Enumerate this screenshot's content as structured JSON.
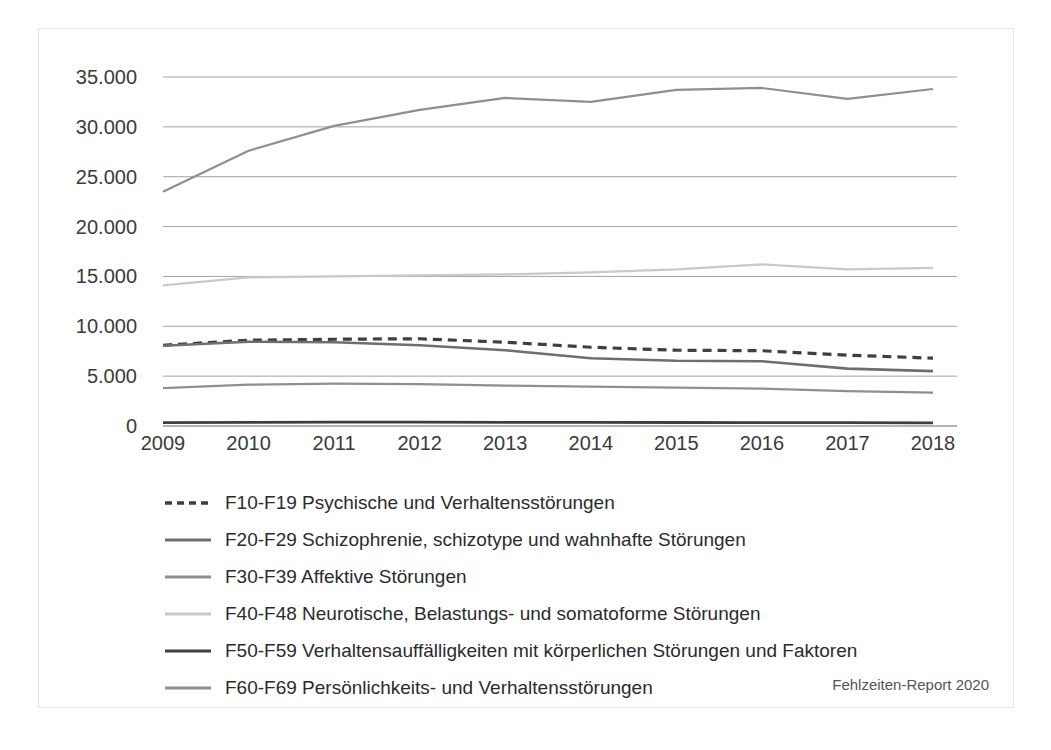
{
  "chart_data": {
    "type": "line",
    "title": "",
    "subtitle": "",
    "xlabel": "",
    "ylabel": "",
    "x": [
      2009,
      2010,
      2011,
      2012,
      2013,
      2014,
      2015,
      2016,
      2017,
      2018
    ],
    "categories": [
      "2009",
      "2010",
      "2011",
      "2012",
      "2013",
      "2014",
      "2015",
      "2016",
      "2017",
      "2018"
    ],
    "ylim": [
      0,
      35000
    ],
    "yticks": [
      0,
      5000,
      10000,
      15000,
      20000,
      25000,
      30000,
      35000
    ],
    "ytick_labels": [
      "0",
      "5.000",
      "10.000",
      "15.000",
      "20.000",
      "25.000",
      "30.000",
      "35.000"
    ],
    "grid": true,
    "legend_position": "below",
    "series": [
      {
        "name": "F10-F19 Psychische und Verhaltensstörungen",
        "color": "#3f3f3f",
        "style": "dashed",
        "width": 3.2,
        "values": [
          8100,
          8600,
          8700,
          8750,
          8400,
          7900,
          7600,
          7550,
          7100,
          6800
        ]
      },
      {
        "name": "F20-F29 Schizophrenie, schizotype und wahnhafte Störungen",
        "color": "#6e6e6e",
        "style": "solid",
        "width": 2.6,
        "values": [
          8050,
          8450,
          8400,
          8100,
          7600,
          6800,
          6550,
          6500,
          5750,
          5500
        ]
      },
      {
        "name": "F30-F39 Affektive Störungen",
        "color": "#8f8f8f",
        "style": "solid",
        "width": 2.2,
        "values": [
          23500,
          27600,
          30100,
          31700,
          32900,
          32500,
          33700,
          33900,
          32800,
          33800
        ]
      },
      {
        "name": "F40-F48 Neurotische, Belastungs- und somatoforme Störungen",
        "color": "#c9c9c9",
        "style": "solid",
        "width": 2.2,
        "values": [
          14100,
          14900,
          15000,
          15100,
          15200,
          15400,
          15700,
          16200,
          15700,
          15850
        ]
      },
      {
        "name": "F50-F59 Verhaltensauffälligkeiten mit körperlichen Störungen und Faktoren",
        "color": "#3f3f3f",
        "style": "solid",
        "width": 2.8,
        "values": [
          330,
          360,
          380,
          380,
          370,
          360,
          350,
          340,
          330,
          320
        ]
      },
      {
        "name": "F60-F69 Persönlichkeits- und Verhaltensstörungen",
        "color": "#8f8f8f",
        "style": "solid",
        "width": 2.2,
        "values": [
          3800,
          4150,
          4250,
          4200,
          4050,
          3950,
          3850,
          3750,
          3500,
          3350
        ]
      }
    ]
  },
  "legend": {
    "items": [
      {
        "label": "F10-F19 Psychische und Verhaltensstörungen",
        "color": "#3f3f3f",
        "style": "dashed"
      },
      {
        "label": "F20-F29 Schizophrenie, schizotype und wahnhafte Störungen",
        "color": "#6e6e6e",
        "style": "solid"
      },
      {
        "label": "F30-F39 Affektive Störungen",
        "color": "#8f8f8f",
        "style": "solid"
      },
      {
        "label": "F40-F48 Neurotische, Belastungs- und somatoforme Störungen",
        "color": "#c9c9c9",
        "style": "solid"
      },
      {
        "label": "F50-F59 Verhaltensauffälligkeiten mit körperlichen Störungen und Faktoren",
        "color": "#3f3f3f",
        "style": "solid"
      },
      {
        "label": "F60-F69 Persönlichkeits- und Verhaltensstörungen",
        "color": "#8f8f8f",
        "style": "solid"
      }
    ]
  },
  "source_note": "Fehlzeiten-Report 2020",
  "colors": {
    "gridline": "#9a9a9a",
    "axis_text": "#3a3a3a",
    "frame": "#e6e6e6",
    "background": "#ffffff"
  }
}
